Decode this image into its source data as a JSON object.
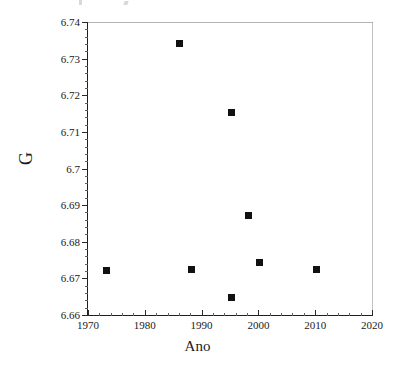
{
  "chart_data": {
    "type": "scatter",
    "title": "",
    "xlabel": "Ano",
    "ylabel": "G",
    "xlim": [
      1970,
      2020
    ],
    "ylim": [
      6.66,
      6.74
    ],
    "grid": false,
    "legend": null,
    "x_major_ticks": [
      1970,
      1980,
      1990,
      2000,
      2010,
      2020
    ],
    "x_tick_labels": [
      "1970",
      "1980",
      "1990",
      "2000",
      "2010",
      "2020"
    ],
    "x_minor_step": 2,
    "y_major_ticks": [
      6.66,
      6.67,
      6.68,
      6.69,
      6.7,
      6.71,
      6.72,
      6.73,
      6.74
    ],
    "y_tick_labels": [
      "6.66",
      "6.67",
      "6.68",
      "6.69",
      "6.7",
      "6.71",
      "6.72",
      "6.73",
      "6.74"
    ],
    "y_minor_step": 0.002,
    "marker": "filled-square",
    "marker_color": "#111111",
    "points": [
      {
        "x": 1973,
        "y": 6.6725
      },
      {
        "x": 1986,
        "y": 6.7345
      },
      {
        "x": 1988,
        "y": 6.6727
      },
      {
        "x": 1995,
        "y": 6.7155
      },
      {
        "x": 1995,
        "y": 6.665
      },
      {
        "x": 1998,
        "y": 6.6875
      },
      {
        "x": 2000,
        "y": 6.6745
      },
      {
        "x": 2010,
        "y": 6.6727
      }
    ]
  },
  "axes": {
    "x_title": "Ano",
    "y_title": "G"
  }
}
